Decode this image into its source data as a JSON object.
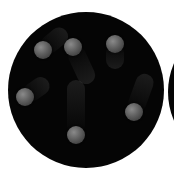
{
  "scene": {
    "description": "Black circular field with six gray spheres showing motion blur trails",
    "colors": {
      "background": "#ffffff",
      "disc": "#050505",
      "sphere": "#6a6a6a"
    },
    "main_disc": {
      "cx": 86,
      "cy": 90,
      "r": 78
    },
    "partial_disc": {
      "cx": 240,
      "cy": 92,
      "r": 72
    },
    "spheres": [
      {
        "id": 1,
        "cx": 43,
        "cy": 50,
        "r": 9,
        "trail_angle": -40,
        "trail_length": 30
      },
      {
        "id": 2,
        "cx": 73,
        "cy": 47,
        "r": 9,
        "trail_angle": 65,
        "trail_length": 40
      },
      {
        "id": 3,
        "cx": 115,
        "cy": 44,
        "r": 9,
        "trail_angle": 90,
        "trail_length": 25
      },
      {
        "id": 4,
        "cx": 25,
        "cy": 97,
        "r": 9,
        "trail_angle": -35,
        "trail_length": 28
      },
      {
        "id": 5,
        "cx": 134,
        "cy": 112,
        "r": 9,
        "trail_angle": -70,
        "trail_length": 40
      },
      {
        "id": 6,
        "cx": 76,
        "cy": 135,
        "r": 9,
        "trail_angle": -90,
        "trail_length": 55
      }
    ]
  }
}
